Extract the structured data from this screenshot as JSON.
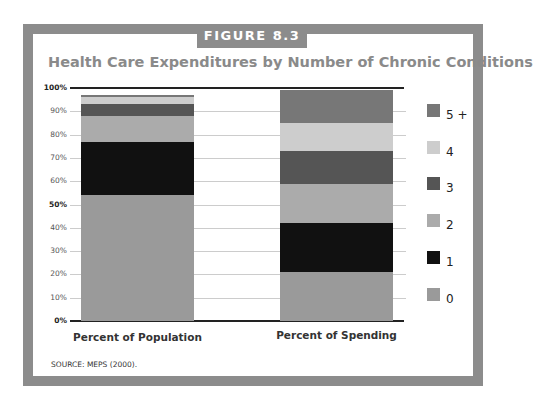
{
  "figure_label": "FIGURE 8.3",
  "source": "SOURCE: MEPS (2000).",
  "colors": {
    "frame": "#8c8c8c",
    "title": "#8a8a8a",
    "0": "#9a9a9a",
    "1": "#111111",
    "2": "#ababab",
    "3": "#555555",
    "4": "#cdcdcd",
    "5+": "#777777"
  },
  "chart_data": {
    "type": "bar",
    "stacked": true,
    "title": "Health Care Expenditures by Number of Chronic Conditions",
    "xlabel": "",
    "ylabel": "",
    "ylim": [
      0,
      100
    ],
    "yticks": [
      "0%",
      "10%",
      "20%",
      "30%",
      "40%",
      "50%",
      "60%",
      "70%",
      "80%",
      "90%",
      "100%"
    ],
    "grid": true,
    "legend_position": "right",
    "categories": [
      "Percent of Population",
      "Percent of Spending"
    ],
    "series": [
      {
        "name": "0",
        "values": [
          54,
          21
        ]
      },
      {
        "name": "1",
        "values": [
          23,
          21
        ]
      },
      {
        "name": "2",
        "values": [
          11,
          17
        ]
      },
      {
        "name": "3",
        "values": [
          5,
          14
        ]
      },
      {
        "name": "4",
        "values": [
          3,
          12
        ]
      },
      {
        "name": "5 +",
        "values": [
          1,
          14
        ]
      }
    ]
  }
}
